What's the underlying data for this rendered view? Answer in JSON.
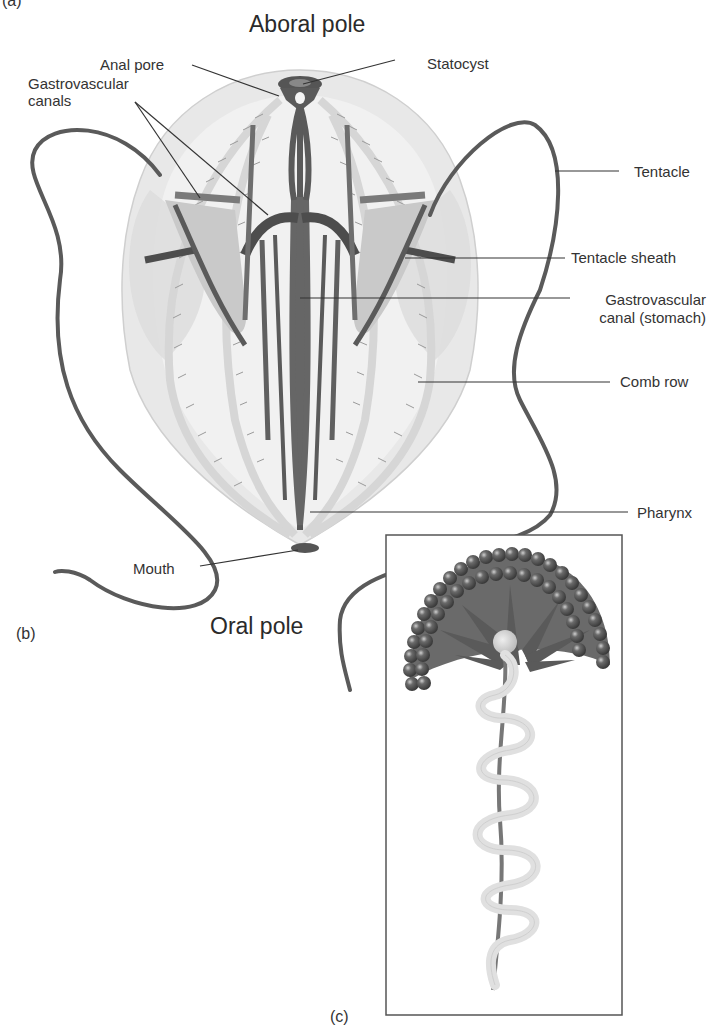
{
  "figure": {
    "panel_a_label": "(a)",
    "panel_b_label": "(b)",
    "panel_c_label": "(c)",
    "aboral_pole": "Aboral pole",
    "oral_pole": "Oral pole"
  },
  "labels": {
    "anal_pore": "Anal pore",
    "gastrovascular_canals_1": "Gastrovascular",
    "gastrovascular_canals_2": "canals",
    "statocyst": "Statocyst",
    "tentacle": "Tentacle",
    "tentacle_sheath": "Tentacle sheath",
    "stomach_1": "Gastrovascular",
    "stomach_2": "canal (stomach)",
    "comb_row": "Comb row",
    "pharynx": "Pharynx",
    "mouth": "Mouth"
  },
  "colors": {
    "body_fill": "#e6e6e6",
    "body_inner": "#f1f1f1",
    "canal_dark": "#555555",
    "canal_mid": "#7a7a7a",
    "tentacle": "#5a5a5a",
    "comb_row": "#d8d8d8",
    "leader_line": "#333333",
    "bead": "#4a4a4a",
    "spiral": "#e3e3e3"
  }
}
